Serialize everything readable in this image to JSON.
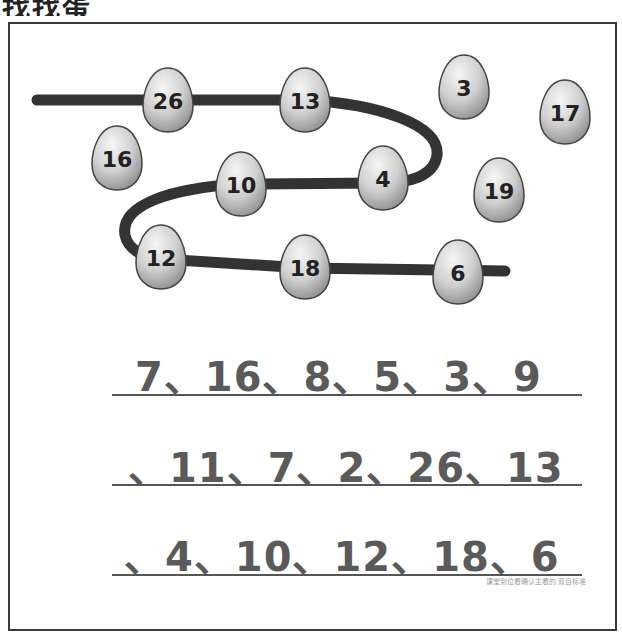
{
  "title": "找找蛋",
  "colors": {
    "path": "#333333",
    "egg_fill_light": "#f2f2f2",
    "egg_fill_dark": "#9c9c9c",
    "egg_stroke": "#444444",
    "sequence_text": "#5a5a5a",
    "frame_border": "#3a3a3a"
  },
  "eggs": [
    {
      "label": "26",
      "cx": 168,
      "cy": 100,
      "on_path": true
    },
    {
      "label": "13",
      "cx": 305,
      "cy": 100,
      "on_path": true
    },
    {
      "label": "3",
      "cx": 464,
      "cy": 87,
      "on_path": false
    },
    {
      "label": "17",
      "cx": 565,
      "cy": 112,
      "on_path": false
    },
    {
      "label": "16",
      "cx": 117,
      "cy": 158,
      "on_path": false
    },
    {
      "label": "10",
      "cx": 241,
      "cy": 184,
      "on_path": true
    },
    {
      "label": "4",
      "cx": 383,
      "cy": 178,
      "on_path": true
    },
    {
      "label": "19",
      "cx": 499,
      "cy": 190,
      "on_path": false
    },
    {
      "label": "12",
      "cx": 161,
      "cy": 257,
      "on_path": true
    },
    {
      "label": "18",
      "cx": 305,
      "cy": 267,
      "on_path": true
    },
    {
      "label": "6",
      "cx": 458,
      "cy": 272,
      "on_path": true
    }
  ],
  "sequence": {
    "line1": "7、16、8、5、3、9",
    "line2": "、11、7、2、26、13",
    "line3": "、4、10、12、18、6"
  },
  "credit": "课堂到位看确认主看的 双目标准"
}
